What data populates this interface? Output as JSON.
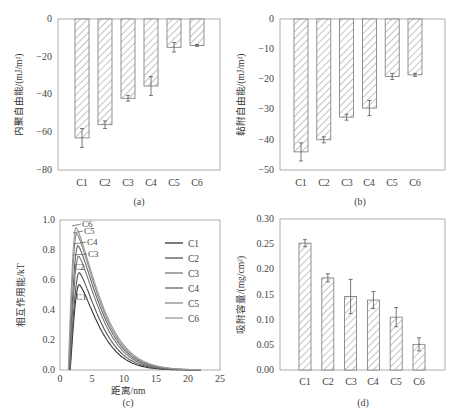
{
  "chart_data": [
    {
      "panel": "a",
      "type": "bar",
      "title": "",
      "subtitle_label": "(a)",
      "xlabel": "",
      "ylabel": "内聚自由能/(mJ/m²)",
      "categories": [
        "C1",
        "C2",
        "C3",
        "C4",
        "C5",
        "C6"
      ],
      "values": [
        -63,
        -56,
        -42,
        -35.5,
        -15,
        -14
      ],
      "errors": [
        5,
        2,
        1.5,
        5,
        2.5,
        0.5
      ],
      "ylim": [
        -80,
        0
      ],
      "yticks": [
        0,
        -20,
        -40,
        -60,
        -80
      ],
      "grid": false,
      "bar_fill": "hatched"
    },
    {
      "panel": "b",
      "type": "bar",
      "title": "",
      "subtitle_label": "(b)",
      "xlabel": "",
      "ylabel": "黏附自由能/(mJ/m²)",
      "categories": [
        "C1",
        "C2",
        "C3",
        "C4",
        "C5",
        "C6"
      ],
      "values": [
        -44,
        -40,
        -32.5,
        -29.5,
        -19,
        -18.5
      ],
      "errors": [
        3,
        1,
        1,
        2.5,
        1,
        0.5
      ],
      "ylim": [
        -50,
        0
      ],
      "yticks": [
        0,
        -10,
        -20,
        -30,
        -40,
        -50
      ],
      "grid": false,
      "bar_fill": "hatched"
    },
    {
      "panel": "c",
      "type": "line",
      "title": "",
      "subtitle_label": "(c)",
      "xlabel": "距离/nm",
      "ylabel": "相互作用能/kT",
      "xlim": [
        0,
        25
      ],
      "ylim": [
        0,
        1.0
      ],
      "xticks": [
        0,
        5,
        10,
        15,
        20,
        25
      ],
      "yticks": [
        0.0,
        0.2,
        0.4,
        0.6,
        0.8,
        1.0
      ],
      "grid": false,
      "legend_position": "upper right",
      "series": [
        {
          "name": "C1",
          "peak_x": 3.0,
          "peak_y": 0.57
        },
        {
          "name": "C2",
          "peak_x": 3.0,
          "peak_y": 0.65
        },
        {
          "name": "C3",
          "peak_x": 2.9,
          "peak_y": 0.76
        },
        {
          "name": "C4",
          "peak_x": 2.8,
          "peak_y": 0.83
        },
        {
          "name": "C5",
          "peak_x": 2.6,
          "peak_y": 0.91
        },
        {
          "name": "C6",
          "peak_x": 2.5,
          "peak_y": 0.95
        }
      ],
      "annotations": [
        "C6",
        "C5",
        "C4",
        "C3",
        "C2",
        "C1"
      ]
    },
    {
      "panel": "d",
      "type": "bar",
      "title": "",
      "subtitle_label": "(d)",
      "xlabel": "",
      "ylabel": "吸附容量/(mg/cm²)",
      "categories": [
        "C1",
        "C2",
        "C3",
        "C4",
        "C5",
        "C6"
      ],
      "values": [
        0.252,
        0.183,
        0.146,
        0.139,
        0.105,
        0.051
      ],
      "errors": [
        0.007,
        0.008,
        0.034,
        0.017,
        0.019,
        0.013
      ],
      "ylim": [
        0,
        0.3
      ],
      "yticks": [
        0.0,
        0.05,
        0.1,
        0.15,
        0.2,
        0.25,
        0.3
      ],
      "grid": false,
      "bar_fill": "hatched"
    }
  ],
  "labels": {
    "a": {
      "ylabel": "内聚自由能/(mJ/m²)",
      "sub": "(a)",
      "yticks": [
        "0",
        "−20",
        "−40",
        "−60",
        "−80"
      ],
      "cats": [
        "C1",
        "C2",
        "C3",
        "C4",
        "C5",
        "C6"
      ]
    },
    "b": {
      "ylabel": "黏附自由能/(mJ/m²)",
      "sub": "(b)",
      "yticks": [
        "0",
        "−10",
        "−20",
        "−30",
        "−40",
        "−50"
      ],
      "cats": [
        "C1",
        "C2",
        "C3",
        "C4",
        "C5",
        "C6"
      ]
    },
    "c": {
      "ylabel": "相互作用能/kT",
      "xlabel": "距离/nm",
      "sub": "(c)",
      "yticks": [
        "1.0",
        "0.8",
        "0.6",
        "0.4",
        "0.2",
        "0.0"
      ],
      "xticks": [
        "0",
        "5",
        "10",
        "15",
        "20",
        "25"
      ],
      "legend": [
        "C1",
        "C2",
        "C3",
        "C4",
        "C5",
        "C6"
      ]
    },
    "d": {
      "ylabel": "吸附容量/(mg/cm²)",
      "sub": "(d)",
      "yticks": [
        "0.30",
        "0.25",
        "0.20",
        "0.15",
        "0.10",
        "0.05",
        "0.00"
      ],
      "cats": [
        "C1",
        "C2",
        "C3",
        "C4",
        "C5",
        "C6"
      ]
    }
  }
}
